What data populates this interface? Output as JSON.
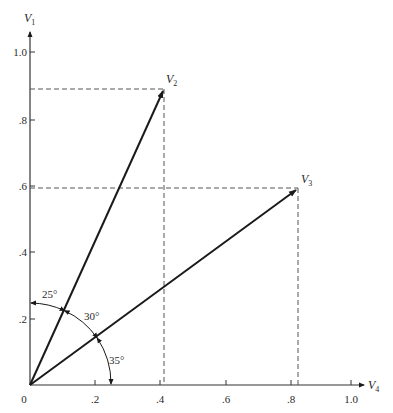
{
  "figure": {
    "type": "vector-projection-diagram",
    "axes": {
      "x": {
        "label": "V",
        "subscript": "4",
        "ticks": [
          {
            "value": 0,
            "label": "0"
          },
          {
            "value": 0.2,
            "label": ".2"
          },
          {
            "value": 0.4,
            "label": ".4"
          },
          {
            "value": 0.6,
            "label": ".6"
          },
          {
            "value": 0.8,
            "label": ".8"
          },
          {
            "value": 1.0,
            "label": "1.0"
          }
        ]
      },
      "y": {
        "label": "V",
        "subscript": "1",
        "ticks": [
          {
            "value": 0.2,
            "label": ".2"
          },
          {
            "value": 0.4,
            "label": ".4"
          },
          {
            "value": 0.6,
            "label": ".6"
          },
          {
            "value": 0.8,
            "label": ".8"
          },
          {
            "value": 1.0,
            "label": "1.0"
          }
        ]
      }
    },
    "vectors": [
      {
        "name": "V",
        "subscript": "2",
        "x": 0.42,
        "y": 0.89,
        "angle_from_V1_deg": 25
      },
      {
        "name": "V",
        "subscript": "3",
        "x": 0.83,
        "y": 0.59,
        "angle_from_V4_deg": 35
      }
    ],
    "angles": [
      {
        "label": "25°",
        "between": "V1 and V2"
      },
      {
        "label": "30°",
        "between": "V2 and V3"
      },
      {
        "label": "35°",
        "between": "V3 and V4"
      }
    ],
    "colors": {
      "line": "#1a1a1a",
      "dashed": "#555555",
      "text": "#2a2a2a"
    }
  }
}
